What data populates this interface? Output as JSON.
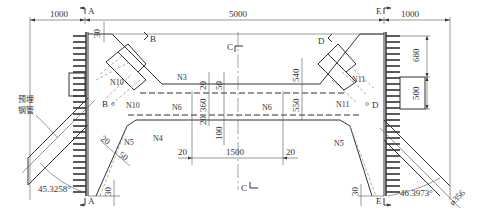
{
  "drawing": {
    "type": "engineering-plan-drawing",
    "dimensions": {
      "left_offset": "1000",
      "total_span": "5000",
      "right_offset": "1000",
      "top_gap_left": "30",
      "bottom_gap_left": "30",
      "bottom_gap_right": "30",
      "right_upper": "680",
      "right_lower": "500",
      "mid_540": "540",
      "mid_550": "550",
      "mid_360": "360",
      "mid_20_top": "20",
      "mid_50": "50",
      "mid_20_bottom": "20",
      "mid_100": "100",
      "bottom_20_left": "20",
      "bottom_1500": "1500",
      "bottom_20_right": "20",
      "slope_20": "20",
      "slope_50": "50",
      "angle_left": "45.3258°",
      "angle_right": "46.3973°",
      "pipe_diameter": "ø356"
    },
    "section_marks": {
      "a_top": "A",
      "a_bottom": "A",
      "b_top": "B",
      "b_bottom": "B",
      "c_top": "C",
      "c_bottom": "C",
      "d_top": "D",
      "d_bottom": "D",
      "e_top": "E",
      "e_bottom": "E"
    },
    "rebar_labels": {
      "n3": "N3",
      "n4": "N4",
      "n5_left": "N5",
      "n5_right": "N5",
      "n6_left": "N6",
      "n6_right": "N6",
      "n10_upper": "N10",
      "n10_lower": "N10",
      "n10_mid": "N10",
      "n11_upper": "N11",
      "n11_lower": "N11"
    },
    "annotations": {
      "embedded_pipe_line1": "预埋",
      "embedded_pipe_line2": "钢管"
    }
  }
}
